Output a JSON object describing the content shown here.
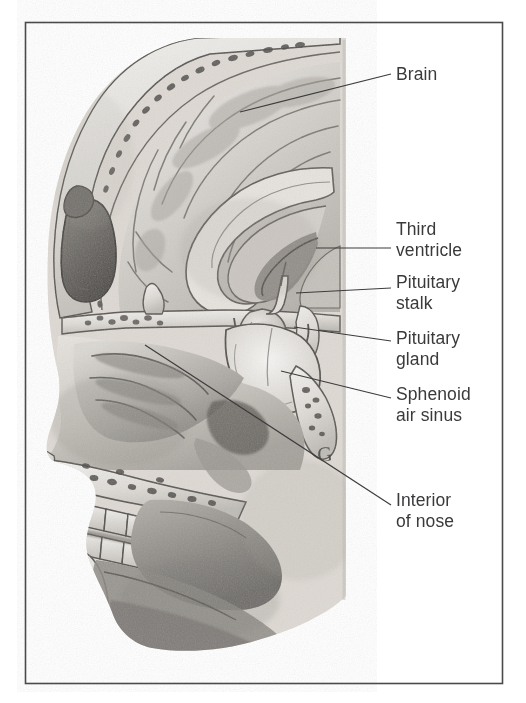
{
  "figure": {
    "type": "anatomical-illustration",
    "medium": "grayscale pencil / halftone drawing",
    "border_color": "#4a4a4a",
    "background_color": "#ffffff",
    "label_color": "#3a3a3c",
    "leader_line_color": "#3c3c3c",
    "frame": {
      "x": 25,
      "y": 22,
      "width": 477,
      "height": 661
    }
  },
  "labels": [
    {
      "id": "brain",
      "text": "Brain",
      "x": 396,
      "y": 64,
      "leader": {
        "x1": 240,
        "y1": 112,
        "x2": 391,
        "y2": 74
      }
    },
    {
      "id": "third-ventricle",
      "text": "Third\nventricle",
      "x": 396,
      "y": 219,
      "leader": {
        "x1": 316,
        "y1": 248,
        "x2": 391,
        "y2": 248
      }
    },
    {
      "id": "pituitary-stalk",
      "text": "Pituitary\nstalk",
      "x": 396,
      "y": 272,
      "leader": {
        "x1": 296,
        "y1": 293,
        "x2": 391,
        "y2": 288
      }
    },
    {
      "id": "pituitary-gland",
      "text": "Pituitary\ngland",
      "x": 396,
      "y": 328,
      "leader": {
        "x1": 294,
        "y1": 327,
        "x2": 391,
        "y2": 341
      }
    },
    {
      "id": "sphenoid-air-sinus",
      "text": "Sphenoid\nair sinus",
      "x": 396,
      "y": 384,
      "leader": {
        "x1": 281,
        "y1": 371,
        "x2": 391,
        "y2": 398
      }
    },
    {
      "id": "interior-of-nose",
      "text": "Interior\nof nose",
      "x": 396,
      "y": 490,
      "leader": {
        "x1": 145,
        "y1": 345,
        "x2": 391,
        "y2": 505
      }
    }
  ],
  "annotation_mark": {
    "id": "handwritten-mark",
    "text": "G",
    "x": 318,
    "y": 450
  },
  "anatomy_regions": [
    {
      "id": "skull-vault",
      "name": "Skull vault with diploe"
    },
    {
      "id": "cerebrum",
      "name": "Cerebral hemisphere with gyri"
    },
    {
      "id": "corpus-callosum",
      "name": "Corpus callosum"
    },
    {
      "id": "third-ventricle-cavity",
      "name": "Third ventricle"
    },
    {
      "id": "pituitary-stalk-anatomy",
      "name": "Pituitary stalk (infundibulum)"
    },
    {
      "id": "pituitary-gland-anatomy",
      "name": "Pituitary gland in sella turcica"
    },
    {
      "id": "sphenoid-sinus",
      "name": "Sphenoid air sinus"
    },
    {
      "id": "frontal-sinus",
      "name": "Frontal air sinus"
    },
    {
      "id": "nasal-cavity",
      "name": "Interior of nose (nasal cavity with turbinates)"
    },
    {
      "id": "hard-palate",
      "name": "Hard palate"
    },
    {
      "id": "upper-teeth",
      "name": "Upper dental arch"
    },
    {
      "id": "lower-teeth",
      "name": "Lower dental arch"
    },
    {
      "id": "mandible",
      "name": "Mandible with cancellous bone"
    },
    {
      "id": "tongue",
      "name": "Tongue"
    }
  ]
}
